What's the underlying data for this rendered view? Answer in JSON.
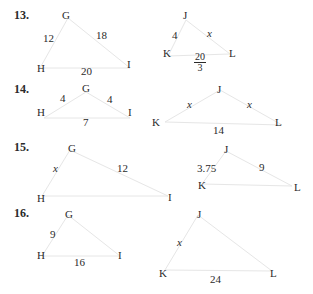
{
  "problems": [
    {
      "number": "13.",
      "triangle1": {
        "vertices": [
          "G",
          "H",
          "I"
        ],
        "sides": {
          "GH": "12",
          "GI": "18",
          "HI": "20"
        }
      },
      "triangle2": {
        "vertices": [
          "J",
          "K",
          "L"
        ],
        "sides": {
          "JK": "4",
          "JL": "x",
          "KL_num": "20",
          "KL_den": "3"
        }
      }
    },
    {
      "number": "14.",
      "triangle1": {
        "vertices": [
          "G",
          "H",
          "I"
        ],
        "sides": {
          "GH": "4",
          "GI": "4",
          "HI": "7"
        }
      },
      "triangle2": {
        "vertices": [
          "J",
          "K",
          "L"
        ],
        "sides": {
          "JK": "x",
          "JL": "x",
          "KL": "14"
        }
      }
    },
    {
      "number": "15.",
      "triangle1": {
        "vertices": [
          "G",
          "H",
          "I"
        ],
        "sides": {
          "GH": "x",
          "GI": "12"
        }
      },
      "triangle2": {
        "vertices": [
          "J",
          "K",
          "L"
        ],
        "sides": {
          "JK": "3.75",
          "JL": "9"
        }
      }
    },
    {
      "number": "16.",
      "triangle1": {
        "vertices": [
          "G",
          "H",
          "I"
        ],
        "sides": {
          "GH": "9",
          "HI": "16"
        }
      },
      "triangle2": {
        "vertices": [
          "J",
          "K",
          "L"
        ],
        "sides": {
          "JK": "x",
          "KL": "24"
        }
      }
    }
  ],
  "colors": {
    "text": "#2a2a2a",
    "lines": "#e4e4e4"
  }
}
